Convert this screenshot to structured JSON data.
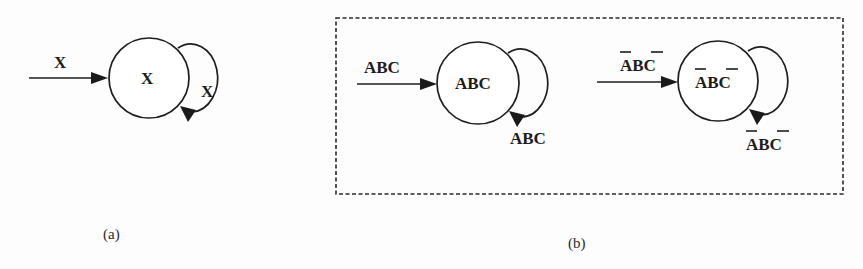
{
  "figure": {
    "panel_a": {
      "caption": "(a)",
      "input_label": "X",
      "state_label": "X",
      "self_loop_label": "X"
    },
    "panel_b": {
      "caption": "(b)",
      "state_1": {
        "input_label": "ABC",
        "state_label": "ABC",
        "self_loop_label": "ABC",
        "overbars": []
      },
      "state_2": {
        "input_label": "ABC",
        "state_label": "ABC",
        "self_loop_label": "ABC",
        "overbars": [
          "A",
          "C"
        ],
        "display": "A̅BC̅"
      }
    }
  }
}
